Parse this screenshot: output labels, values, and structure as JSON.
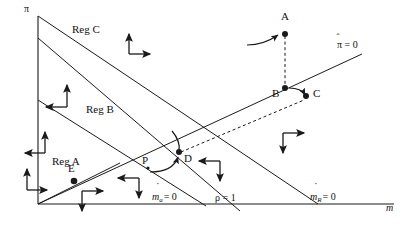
{
  "figure": {
    "type": "phase-diagram",
    "title": "",
    "background_color": "#ffffff",
    "line_color": "#1a1a1a",
    "width": 408,
    "height": 239
  },
  "axes": {
    "y_label": "π",
    "x_label": "m",
    "y_axis_name": "pi-axis",
    "x_axis_name": "m-axis",
    "origin": [
      38,
      204
    ],
    "x_end": [
      392,
      204
    ],
    "y_end": [
      38,
      14
    ]
  },
  "regions": [
    {
      "id": "reg-c",
      "label": "Reg C",
      "x": 72,
      "y": 28
    },
    {
      "id": "reg-b",
      "label": "Reg B",
      "x": 86,
      "y": 108
    },
    {
      "id": "reg-a",
      "label": "Reg A",
      "x": 52,
      "y": 160
    }
  ],
  "points": [
    {
      "id": "point-a",
      "label": "A",
      "x": 285,
      "y": 32,
      "lx": 278,
      "ly": 12
    },
    {
      "id": "point-b",
      "label": "B",
      "x": 285,
      "y": 90,
      "lx": 271,
      "ly": 95
    },
    {
      "id": "point-c",
      "label": "C",
      "x": 307,
      "y": 96,
      "lx": 312,
      "ly": 92
    },
    {
      "id": "point-d",
      "label": "D",
      "x": 177,
      "y": 155,
      "lx": 182,
      "ly": 157
    },
    {
      "id": "point-e",
      "label": "E",
      "x": 73,
      "y": 182,
      "lx": 67,
      "ly": 165
    },
    {
      "id": "point-p",
      "label": "P",
      "x": 146,
      "y": 166,
      "lx": 141,
      "ly": 159
    }
  ],
  "isoclines": [
    {
      "id": "pi-hat-zero",
      "label": "π̂ = 0",
      "label_main": "π",
      "label_tail": " = 0",
      "label_x": 336,
      "label_y": 45,
      "from": [
        38,
        204
      ],
      "to": [
        360,
        55
      ]
    },
    {
      "id": "m-a-dot-zero",
      "label": "ṁₐ = 0",
      "label_main": "m",
      "label_sub": "a",
      "label_tail": "= 0",
      "label_x": 153,
      "label_y": 196,
      "from": [
        38,
        38
      ],
      "to": [
        232,
        204
      ]
    },
    {
      "id": "rho-one",
      "label": "ρ = 1",
      "label_main": "ρ = 1",
      "label_x": 216,
      "label_y": 196,
      "from": [
        38,
        100
      ],
      "to": [
        203,
        204
      ]
    },
    {
      "id": "m-r-dot-zero",
      "label": "ṁᴿ = 0",
      "label_main": "m",
      "label_sub": "R",
      "label_tail": "= 0",
      "label_x": 312,
      "label_y": 196,
      "from": [
        38,
        204
      ],
      "to": [
        316,
        204
      ]
    }
  ],
  "vector_arrows": [
    {
      "id": "arrow-reg-c",
      "x": 129,
      "y": 33,
      "up": true,
      "right": true
    },
    {
      "id": "arrow-reg-b-upper",
      "x": 67,
      "y": 87,
      "up": true,
      "right": false
    },
    {
      "id": "arrow-reg-b-lower",
      "x": 43,
      "y": 138,
      "up": true,
      "right": false
    },
    {
      "id": "arrow-reg-a",
      "x": 25,
      "y": 172,
      "up": true,
      "right": true
    },
    {
      "id": "arrow-below-e",
      "x": 68,
      "y": 196,
      "up": false,
      "right": true
    },
    {
      "id": "arrow-near-p",
      "x": 135,
      "y": 178,
      "up": false,
      "right": false
    },
    {
      "id": "arrow-right-d",
      "x": 205,
      "y": 161,
      "up": false,
      "right": false
    },
    {
      "id": "arrow-far-right",
      "x": 280,
      "y": 133,
      "up": false,
      "right": true
    }
  ],
  "dashed_paths": [
    {
      "id": "dash-a-to-b",
      "from": [
        285,
        34
      ],
      "to": [
        285,
        89
      ]
    },
    {
      "id": "dash-d-to-c",
      "from": [
        180,
        152
      ],
      "to": [
        305,
        99
      ]
    }
  ],
  "trajectories": [
    {
      "id": "traj-into-a",
      "name": "curve-approaching-a"
    },
    {
      "id": "traj-b-to-c",
      "name": "curve-b-to-c"
    },
    {
      "id": "traj-p-to-d",
      "name": "curve-p-through-d"
    }
  ]
}
